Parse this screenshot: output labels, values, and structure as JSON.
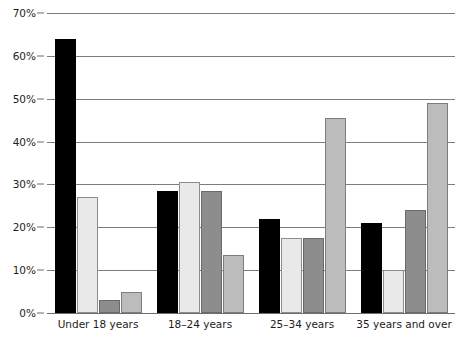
{
  "chart_data": {
    "type": "bar",
    "title": "",
    "subtitle": "",
    "xlabel": "",
    "ylabel": "",
    "categories": [
      "Under 18 years",
      "18–24 years",
      "25–34 years",
      "35 years and over"
    ],
    "series": [
      {
        "name": "Series 1",
        "color": "#000000",
        "values": [
          64,
          28.5,
          22,
          21
        ]
      },
      {
        "name": "Series 2",
        "color": "#e9e9e9",
        "values": [
          27,
          30.5,
          17.5,
          10
        ]
      },
      {
        "name": "Series 3",
        "color": "#8d8d8d",
        "values": [
          3,
          28.5,
          17.5,
          24
        ]
      },
      {
        "name": "Series 4",
        "color": "#bcbcbc",
        "values": [
          5,
          13.5,
          45.5,
          49
        ]
      }
    ],
    "ylim": [
      0,
      70
    ],
    "ytick_values": [
      0,
      10,
      20,
      30,
      40,
      50,
      60,
      70
    ],
    "ytick_labels": [
      "0%",
      "10%",
      "20%",
      "30%",
      "40%",
      "50%",
      "60%",
      "70%"
    ],
    "grid": true,
    "legend": "none",
    "annotations": []
  },
  "colors": {
    "series_1": "#000000",
    "series_2": "#e9e9e9",
    "series_3": "#8d8d8d",
    "series_4": "#bcbcbc",
    "gridline": "#7d7d7d",
    "axis_text": "#1d1d1d",
    "background": "#ffffff"
  }
}
